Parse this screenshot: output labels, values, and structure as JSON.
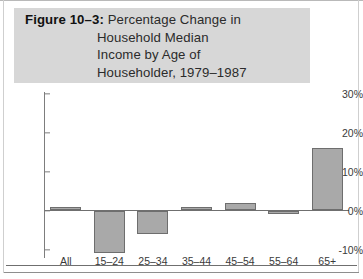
{
  "figure": {
    "label": "Figure 10–3:",
    "title_lines": [
      "Percentage Change in",
      "Household Median",
      "Income by Age of",
      "Householder, 1979–1987"
    ],
    "band_color": "#d7d7d7",
    "bar_fill_color": "#a9a9a9",
    "bar_border_color": "#6e6e6e",
    "axis_color": "#6f6f6f"
  },
  "chart_data": {
    "type": "bar",
    "title": "Figure 10–3: Percentage Change in Household Median Income by Age of Householder, 1979–1987",
    "xlabel": "",
    "ylabel": "",
    "categories": [
      "All",
      "15–24",
      "25–34",
      "35–44",
      "45–54",
      "55–64",
      "65+"
    ],
    "values": [
      1,
      -11,
      -6,
      1,
      2,
      -1,
      16
    ],
    "ylim": [
      -10,
      30
    ],
    "yticks": [
      -10,
      0,
      10,
      20,
      30
    ],
    "ytick_labels": [
      "-10%",
      "0%",
      "10%",
      "20%",
      "30%"
    ],
    "grid": false,
    "legend": null,
    "value_unit": "percent"
  }
}
